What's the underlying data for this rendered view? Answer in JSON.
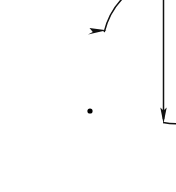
{
  "figure": {
    "canvas": {
      "width": 176,
      "height": 192,
      "background": "#ffffff"
    },
    "style": {
      "stroke_color": "#111111",
      "dot_color": "#000000",
      "stroke_width": 1.5
    },
    "elements": {
      "center_point": {
        "name": "center-point",
        "cx": 90,
        "cy": 111,
        "r": 2.6
      },
      "circular_arc": {
        "name": "circular-arc",
        "center_x": 90,
        "center_y": 111,
        "radius": 74,
        "start_angle_deg": 9,
        "end_angle_deg": 196,
        "direction": "clockwise",
        "path": "M 163.1 122.6 A 74 74 0 1 0 104.2 32.1"
      },
      "arc_arrowhead": {
        "name": "arc-arrowhead",
        "tip_x": 106,
        "tip_y": 30,
        "direction": "right",
        "points": "106.5,30.2 89.5,28.0 92.8,32.0 88.0,34.5"
      },
      "vertical_line": {
        "name": "vertical-line",
        "x": 163.5,
        "y_start": 0,
        "y_end": 120,
        "path": "M 163.5 0 L 163.5 119"
      },
      "vertical_arrowhead": {
        "name": "vertical-arrowhead",
        "tip_x": 163.5,
        "tip_y": 123,
        "direction": "down",
        "points": "163.5,123.5 160.3,107.5 163.5,110.6 166.7,107.5"
      }
    },
    "labels": []
  }
}
